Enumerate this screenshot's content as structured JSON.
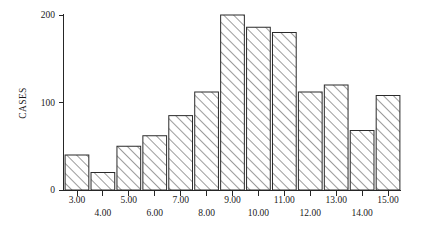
{
  "chart_data": {
    "type": "bar",
    "title": "",
    "subtitle": "",
    "xlabel": "",
    "ylabel": "CASES",
    "categories": [
      "3.00",
      "4.00",
      "5.00",
      "6.00",
      "7.00",
      "8.00",
      "9.00",
      "10.00",
      "11.00",
      "12.00",
      "13.00",
      "14.00",
      "15.00"
    ],
    "values": [
      40,
      20,
      50,
      62,
      85,
      112,
      200,
      186,
      180,
      112,
      120,
      68,
      108
    ],
    "ylim": [
      0,
      200
    ],
    "yticks": [
      "0",
      "100",
      "200"
    ],
    "ytick_values": [
      0,
      100,
      200
    ],
    "grid": false,
    "legend": false,
    "legend_position": "none",
    "bar_fill": "#ffffff",
    "bar_edge": "#2b2b2b",
    "hatch": "diagonal-forward",
    "axis_color": "#262626",
    "background": "#ffffff",
    "xtick_row_upper": [
      "3.00",
      "5.00",
      "7.00",
      "9.00",
      "11.00",
      "13.00",
      "15.00"
    ],
    "xtick_row_lower": [
      "4.00",
      "6.00",
      "8.00",
      "10.00",
      "12.00",
      "14.00"
    ]
  }
}
